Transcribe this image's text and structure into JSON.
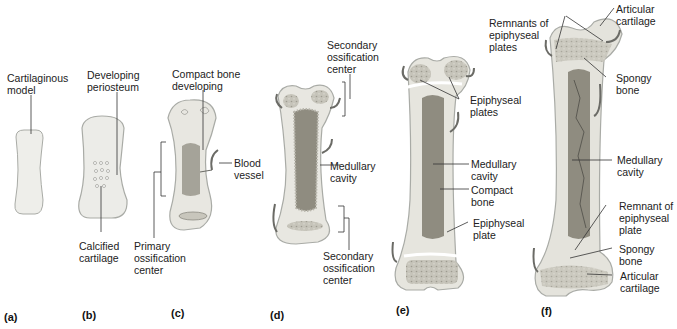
{
  "figure": {
    "colors": {
      "cartilage": "#eeeeea",
      "cartilage_edge": "#a9aba6",
      "bone_shaft": "#dcdbd3",
      "compact_bone": "#cfcdc4",
      "medullary": "#8f8c80",
      "spongy": "#c4c2b8",
      "vessel": "#6b6b66",
      "line": "#333333"
    },
    "panels": [
      {
        "id": "a",
        "label": "(a)",
        "annotations": [
          {
            "text": "Cartilaginous\nmodel"
          }
        ]
      },
      {
        "id": "b",
        "label": "(b)",
        "annotations": [
          {
            "text": "Developing\nperiosteum"
          },
          {
            "text": "Calcified\ncartilage"
          }
        ]
      },
      {
        "id": "c",
        "label": "(c)",
        "annotations": [
          {
            "text": "Compact bone\ndeveloping"
          },
          {
            "text": "Blood\nvessel"
          },
          {
            "text": "Primary\nossification\ncenter"
          }
        ]
      },
      {
        "id": "d",
        "label": "(d)",
        "annotations": [
          {
            "text": "Secondary\nossification\ncenter"
          },
          {
            "text": "Medullary\ncavity"
          },
          {
            "text": "Secondary\nossification\ncenter"
          }
        ]
      },
      {
        "id": "e",
        "label": "(e)",
        "annotations": [
          {
            "text": "Epiphyseal\nplates"
          },
          {
            "text": "Medullary\ncavity"
          },
          {
            "text": "Compact\nbone"
          },
          {
            "text": "Epiphyseal\nplate"
          }
        ]
      },
      {
        "id": "f",
        "label": "(f)",
        "annotations": [
          {
            "text": "Remnants of\nepiphyseal\nplates"
          },
          {
            "text": "Articular\ncartilage"
          },
          {
            "text": "Spongy\nbone"
          },
          {
            "text": "Medullary\ncavity"
          },
          {
            "text": "Remnant of\nepiphyseal\nplate"
          },
          {
            "text": "Spongy\nbone"
          },
          {
            "text": "Articular\ncartilage"
          }
        ]
      }
    ]
  }
}
